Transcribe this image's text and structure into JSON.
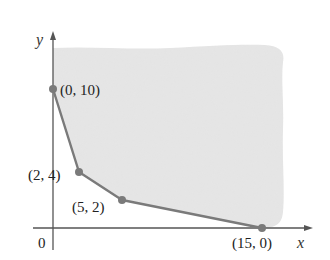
{
  "figure": {
    "axes": {
      "x_label": "x",
      "y_label": "y",
      "origin_label": "0"
    },
    "vertices": [
      {
        "label": "(0, 10)",
        "x": 0,
        "y": 10
      },
      {
        "label": "(2, 4)",
        "x": 2,
        "y": 4
      },
      {
        "label": "(5, 2)",
        "x": 5,
        "y": 2
      },
      {
        "label": "(15, 0)",
        "x": 15,
        "y": 0
      }
    ],
    "region": "unbounded feasible region above the boundary polyline",
    "colors": {
      "region_fill": "#e6e6e6",
      "boundary": "#7a7a7a",
      "axis": "#555555",
      "point": "#7a7a7a"
    }
  }
}
